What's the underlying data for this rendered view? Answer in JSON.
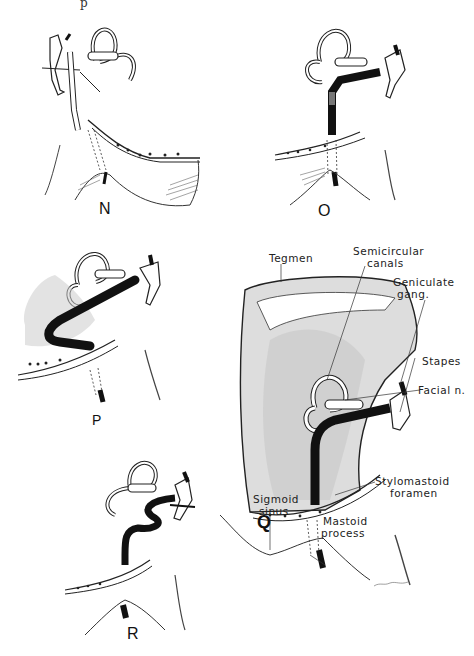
{
  "figure": {
    "top_fragment": "p",
    "panels": [
      {
        "id": "N",
        "label": "N"
      },
      {
        "id": "O",
        "label": "O"
      },
      {
        "id": "P",
        "label": "P"
      },
      {
        "id": "Q",
        "label": "Q"
      },
      {
        "id": "R",
        "label": "R"
      }
    ],
    "annotations": {
      "tegmen": "Tegmen",
      "semicircular_canals_1": "Semicircular",
      "semicircular_canals_2": "canals",
      "geniculate_1": "Geniculate",
      "geniculate_2": "gang.",
      "stapes": "Stapes",
      "facial": "Facial n.",
      "stylomastoid_1": "Stylomastoid",
      "stylomastoid_2": "foramen",
      "sigmoid_1": "Sigmoid",
      "sigmoid_2": "sinus",
      "mastoid_1": "Mastoid",
      "mastoid_2": "process"
    },
    "signature": "artist signature"
  }
}
